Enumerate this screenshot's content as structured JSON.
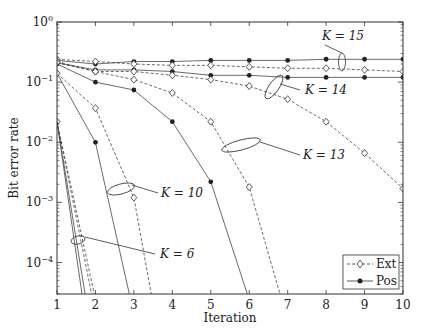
{
  "chart_data": {
    "type": "line",
    "title": "",
    "xlabel": "Iteration",
    "ylabel": "Bit error rate",
    "xlim": [
      1,
      10
    ],
    "ylim": [
      3e-05,
      1
    ],
    "yscale": "log",
    "x_ticks": [
      "1",
      "2",
      "3",
      "4",
      "5",
      "6",
      "7",
      "8",
      "9",
      "10"
    ],
    "y_ticks": [
      {
        "base": "10",
        "exp": "0"
      },
      {
        "base": "10",
        "exp": "−1"
      },
      {
        "base": "10",
        "exp": "−2"
      },
      {
        "base": "10",
        "exp": "−3"
      },
      {
        "base": "10",
        "exp": "−4"
      }
    ],
    "grid": false,
    "legend": {
      "position": "bottom-right",
      "entries": [
        {
          "label": "Ext",
          "style": "dashed",
          "marker": "diamond"
        },
        {
          "label": "Pos",
          "style": "solid",
          "marker": "dot"
        }
      ]
    },
    "series": [
      {
        "name": "K=15 Pos",
        "style": "solid",
        "marker": "dot",
        "x": [
          1,
          2,
          3,
          4,
          5,
          6,
          7,
          8,
          9,
          10
        ],
        "y": [
          0.23,
          0.2,
          0.22,
          0.22,
          0.23,
          0.23,
          0.23,
          0.24,
          0.24,
          0.24
        ]
      },
      {
        "name": "K=15 Ext",
        "style": "dashed",
        "marker": "diamond",
        "x": [
          1,
          2,
          3,
          4,
          5,
          6,
          7,
          8,
          9,
          10
        ],
        "y": [
          0.24,
          0.22,
          0.2,
          0.19,
          0.19,
          0.18,
          0.17,
          0.17,
          0.16,
          0.15
        ]
      },
      {
        "name": "K=14 Pos",
        "style": "solid",
        "marker": "dot",
        "x": [
          1,
          2,
          3,
          4,
          5,
          6,
          7,
          8,
          9,
          10
        ],
        "y": [
          0.21,
          0.16,
          0.16,
          0.15,
          0.13,
          0.13,
          0.12,
          0.12,
          0.12,
          0.12
        ]
      },
      {
        "name": "K=14 Ext",
        "style": "dashed",
        "marker": "diamond",
        "x": [
          1,
          2,
          3,
          4,
          5,
          6,
          7,
          8,
          9,
          10
        ],
        "y": [
          0.22,
          0.15,
          0.15,
          0.13,
          0.11,
          0.086,
          0.052,
          0.022,
          0.0066,
          0.0017
        ]
      },
      {
        "name": "K=13 Pos",
        "style": "solid",
        "marker": "dot",
        "x": [
          1,
          2,
          3,
          4,
          5,
          5.95
        ],
        "y": [
          0.2,
          0.1,
          0.074,
          0.022,
          0.0022,
          3e-05
        ]
      },
      {
        "name": "K=13 Ext",
        "style": "dashed",
        "marker": "diamond",
        "x": [
          1,
          2,
          3,
          4,
          5,
          6,
          6.8
        ],
        "y": [
          0.21,
          0.15,
          0.11,
          0.066,
          0.022,
          0.0018,
          3e-05
        ]
      },
      {
        "name": "K=10 Pos",
        "style": "solid",
        "marker": "dot",
        "x": [
          1,
          2,
          2.88
        ],
        "y": [
          0.14,
          0.01,
          3e-05
        ]
      },
      {
        "name": "K=10 Ext",
        "style": "dashed",
        "marker": "diamond",
        "x": [
          1,
          2,
          3,
          3.45
        ],
        "y": [
          0.14,
          0.037,
          0.0012,
          3e-05
        ]
      },
      {
        "name": "K=6 Pos",
        "style": "solid",
        "marker": "dot",
        "x": [
          1,
          1.73
        ],
        "y": [
          0.022,
          3e-05
        ]
      },
      {
        "name": "K=6 Ext",
        "style": "dashed",
        "marker": "diamond",
        "x": [
          1,
          1.97
        ],
        "y": [
          0.022,
          3e-05
        ]
      },
      {
        "name": "K=6 Pos b",
        "style": "solid",
        "marker": "none",
        "x": [
          1,
          1.65
        ],
        "y": [
          0.022,
          3e-05
        ]
      },
      {
        "name": "K=6 Ext b",
        "style": "dashed",
        "marker": "none",
        "x": [
          1,
          1.9
        ],
        "y": [
          0.022,
          3e-05
        ]
      }
    ],
    "annotations": [
      {
        "label": "K = 15",
        "target_x": 8.45,
        "target_y": 0.2
      },
      {
        "label": "K = 14",
        "target_x": 5.8,
        "target_y": 0.12
      },
      {
        "label": "K = 13",
        "target_x": 5.0,
        "target_y": 0.0035
      },
      {
        "label": "K = 10",
        "target_x": 2.65,
        "target_y": 0.0016
      },
      {
        "label": "K = 6",
        "target_x": 1.55,
        "target_y": 0.00023
      }
    ]
  }
}
